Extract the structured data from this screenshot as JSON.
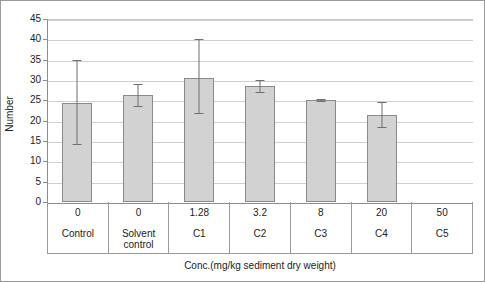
{
  "chart_data": {
    "type": "bar",
    "title": "",
    "xlabel": "Conc.(mg/kg sediment dry weight)",
    "ylabel": "Number",
    "ylim": [
      0,
      45
    ],
    "ytick_step": 5,
    "yticks": [
      "45",
      "40",
      "35",
      "30",
      "25",
      "20",
      "15",
      "10",
      "5",
      "0"
    ],
    "grid": true,
    "legend": "none",
    "categories": [
      "Control",
      "Solvent control",
      "C1",
      "C2",
      "C3",
      "C4",
      "C5"
    ],
    "concentrations": [
      "0",
      "0",
      "1.28",
      "3.2",
      "8",
      "20",
      "50"
    ],
    "values": [
      24.3,
      26.4,
      30.6,
      28.5,
      25.0,
      21.4,
      0
    ],
    "errors_upper": [
      10.7,
      2.7,
      9.4,
      1.6,
      0.4,
      3.3,
      0
    ],
    "errors_lower": [
      10.4,
      3.1,
      8.9,
      1.6,
      0.4,
      3.2,
      0
    ],
    "series": [
      {
        "name": "Number",
        "values": [
          24.3,
          26.4,
          30.6,
          28.5,
          25.0,
          21.4,
          0
        ]
      }
    ],
    "bar_color": "#d2d2d2",
    "bar_border_color": "#8a8a8a",
    "error_bar_color": "#6f6f6f",
    "grid_color": "#cfcfcf",
    "axis_color": "#8d8d8d"
  },
  "axis": {
    "y_title": "Number",
    "x_title": "Conc.(mg/kg sediment dry weight)"
  },
  "columns": [
    {
      "conc": "0",
      "name": "Control",
      "name2": ""
    },
    {
      "conc": "0",
      "name": "Solvent",
      "name2": "control"
    },
    {
      "conc": "1.28",
      "name": "C1",
      "name2": ""
    },
    {
      "conc": "3.2",
      "name": "C2",
      "name2": ""
    },
    {
      "conc": "8",
      "name": "C3",
      "name2": ""
    },
    {
      "conc": "20",
      "name": "C4",
      "name2": ""
    },
    {
      "conc": "50",
      "name": "C5",
      "name2": ""
    }
  ]
}
